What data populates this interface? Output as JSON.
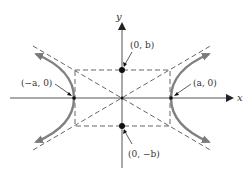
{
  "diagram": {
    "axes": {
      "x_label": "x",
      "y_label": "y"
    },
    "points": [
      {
        "label": "(0, b)",
        "coord": "(0, b)"
      },
      {
        "label": "(0, −b)",
        "coord": "(0, -b)"
      },
      {
        "label": "(−a, 0)",
        "coord": "(-a, 0)"
      },
      {
        "label": "(a, 0)",
        "coord": "(a, 0)"
      }
    ],
    "elements": {
      "branches": 2,
      "asymptotes": 2,
      "central_rectangle": "dashed"
    },
    "colors": {
      "curve": "#808080",
      "axis": "#555555",
      "dash": "#555555",
      "point": "#111111"
    }
  }
}
